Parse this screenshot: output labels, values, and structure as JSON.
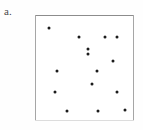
{
  "panel": {
    "label": "a.",
    "label_color": "#4a4a4a",
    "background_color": "#ffffff",
    "frame_color": "#9a9a9a",
    "point_color": "#1c1c1c",
    "point_size_px": 3
  },
  "chart_data": {
    "type": "scatter",
    "title": "a.",
    "xlabel": "",
    "ylabel": "",
    "xlim": [
      0,
      99
    ],
    "ylim": [
      0,
      106
    ],
    "grid": false,
    "legend": null,
    "tick_labels_x": [],
    "tick_labels_y": [],
    "n_points": 15,
    "series": [
      {
        "name": "points",
        "color": "#1c1c1c",
        "marker": "circle",
        "x": [
          14,
          44,
          70,
          82,
          53,
          78,
          22,
          62,
          57,
          20,
          82,
          32,
          63,
          90,
          53
        ],
        "y": [
          13,
          22,
          22,
          22,
          39,
          46,
          56,
          56,
          69,
          77,
          77,
          96,
          96,
          95,
          34
        ]
      }
    ],
    "points": [
      {
        "x": 14,
        "y": 13
      },
      {
        "x": 44,
        "y": 22
      },
      {
        "x": 70,
        "y": 22
      },
      {
        "x": 82,
        "y": 22
      },
      {
        "x": 53,
        "y": 34
      },
      {
        "x": 53,
        "y": 39
      },
      {
        "x": 78,
        "y": 46
      },
      {
        "x": 22,
        "y": 56
      },
      {
        "x": 62,
        "y": 56
      },
      {
        "x": 57,
        "y": 69
      },
      {
        "x": 20,
        "y": 77
      },
      {
        "x": 82,
        "y": 77
      },
      {
        "x": 32,
        "y": 96
      },
      {
        "x": 63,
        "y": 96
      },
      {
        "x": 90,
        "y": 95
      }
    ]
  }
}
